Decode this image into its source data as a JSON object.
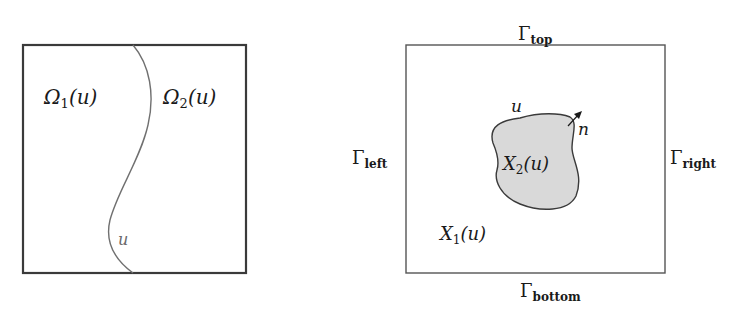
{
  "left_figure": {
    "domain1": {
      "symbol": "Ω",
      "subscript": "1",
      "arg": "(u)"
    },
    "domain2": {
      "symbol": "Ω",
      "subscript": "2",
      "arg": "(u)"
    },
    "interface_label": "u"
  },
  "right_figure": {
    "boundaries": {
      "top": {
        "symbol": "Γ",
        "subscript": "top"
      },
      "bottom": {
        "symbol": "Γ",
        "subscript": "bottom"
      },
      "left": {
        "symbol": "Γ",
        "subscript": "left"
      },
      "right": {
        "symbol": "Γ",
        "subscript": "right"
      }
    },
    "outer_region": {
      "symbol": "X",
      "subscript": "1",
      "arg": "(u)"
    },
    "inner_region": {
      "symbol": "X",
      "subscript": "2",
      "arg": "(u)"
    },
    "interface_label": "u",
    "normal_label": "n"
  },
  "colors": {
    "stroke": "#3a3a3a",
    "curve": "#707070",
    "inclusion_fill": "#d9d9d9"
  }
}
